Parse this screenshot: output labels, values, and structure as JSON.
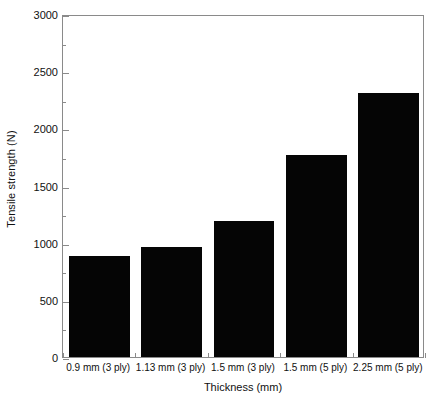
{
  "chart_data": {
    "type": "bar",
    "title": "",
    "xlabel": "Thickness (mm)",
    "ylabel": "Tensile strength (N)",
    "categories": [
      "0.9 mm (3 ply)",
      "1.13 mm (3 ply)",
      "1.5 mm (3 ply)",
      "1.5 mm (5 ply)",
      "2.25 mm (5 ply)"
    ],
    "values": [
      880,
      960,
      1190,
      1770,
      2310
    ],
    "ylim": [
      0,
      3000
    ],
    "ytick_values": [
      0,
      500,
      1000,
      1500,
      2000,
      2500,
      3000
    ],
    "ytick_labels": [
      "0",
      "500",
      "1000",
      "1500",
      "2000",
      "2500",
      "3000"
    ],
    "yminor_tick_values": [
      250,
      750,
      1250,
      1750,
      2250,
      2750
    ],
    "grid": false,
    "legend": null,
    "bar_color": "#050505",
    "axis_color": "#8a8a8a",
    "text_color": "#111111",
    "background_color": "#ffffff"
  }
}
